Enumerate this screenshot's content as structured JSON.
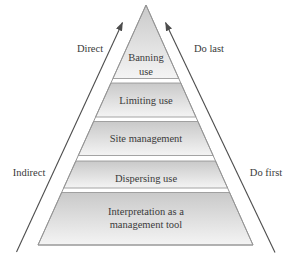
{
  "diagram": {
    "type": "pyramid",
    "levels": [
      {
        "label": "Banning use",
        "line1": "Banning",
        "line2": "use"
      },
      {
        "label": "Limiting use",
        "line1": "Limiting use"
      },
      {
        "label": "Site management",
        "line1": "Site management"
      },
      {
        "label": "Dispersing use",
        "line1": "Dispersing use"
      },
      {
        "label": "Interpretation as a management tool",
        "line1": "Interpretation as a",
        "line2": "management tool"
      }
    ],
    "arrows": {
      "left": {
        "top_label": "Direct",
        "bottom_label": "Indirect",
        "direction": "up"
      },
      "right": {
        "top_label": "Do last",
        "bottom_label": "Do first",
        "direction": "up"
      }
    },
    "colors": {
      "background": "#ffffff",
      "band_fill_top": "#c9c9c9",
      "band_fill_bottom": "#f4f4f4",
      "band_border": "#8e8e8e",
      "pyramid_outline": "#949494",
      "arrow": "#4d4d4d",
      "text": "#3a3a3a"
    }
  }
}
